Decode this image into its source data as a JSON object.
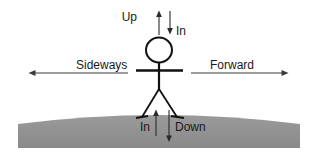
{
  "diagram": {
    "background_color": "#ffffff",
    "ground": {
      "name": "curved-ground",
      "color": "#8d8d8d",
      "edge_color": "#9a9a9a",
      "description": "convex gray curved ground surface"
    },
    "figure": {
      "name": "stick-figure",
      "color": "#111111",
      "parts": [
        "head",
        "torso",
        "arms",
        "left-leg",
        "right-leg",
        "left-foot",
        "right-foot"
      ]
    },
    "labels": {
      "up": "Up",
      "in_top": "In",
      "sideways": "Sideways",
      "forward": "Forward",
      "in_bottom": "In",
      "down": "Down"
    },
    "arrows": [
      {
        "name": "up-arrow",
        "label": "Up",
        "direction": "up"
      },
      {
        "name": "in-top-arrow",
        "label": "In",
        "direction": "down"
      },
      {
        "name": "sideways-arrow",
        "label": "Sideways",
        "direction": "left"
      },
      {
        "name": "forward-arrow",
        "label": "Forward",
        "direction": "right"
      },
      {
        "name": "in-bottom-arrow",
        "label": "In",
        "direction": "up"
      },
      {
        "name": "down-arrow",
        "label": "Down",
        "direction": "down"
      }
    ]
  }
}
